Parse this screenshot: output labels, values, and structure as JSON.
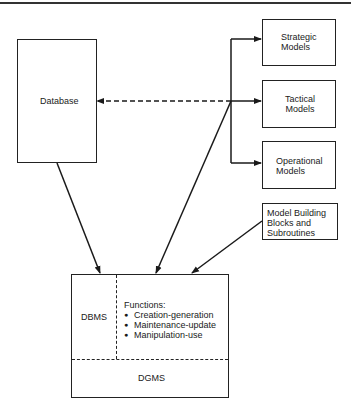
{
  "diagram": {
    "database": {
      "label": "Database"
    },
    "models": [
      {
        "label_line1": "Strategic",
        "label_line2": "Models"
      },
      {
        "label_line1": "Tactical",
        "label_line2": "Models"
      },
      {
        "label_line1": "Operational",
        "label_line2": "Models"
      }
    ],
    "model_building": {
      "line1": "Model Building",
      "line2": "Blocks and",
      "line3": "Subroutines"
    },
    "system": {
      "dbms_label": "DBMS",
      "functions_title": "Functions:",
      "functions": [
        "Creation-generation",
        "Maintenance-update",
        "Manipulation-use"
      ],
      "dgms_label": "DGMS"
    },
    "colors": {
      "line": "#1a1a1a",
      "background": "#ffffff"
    }
  }
}
